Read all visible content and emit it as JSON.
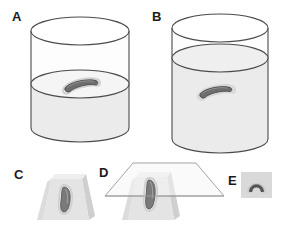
{
  "figure": {
    "background_color": "#ffffff",
    "width": 281,
    "height": 228
  },
  "panels": [
    {
      "id": "A",
      "label": "A",
      "caption": "Cylindrical container partially filled with liquid; curved specimen resting at the liquid surface",
      "container_shape": "cylinder",
      "fill_level_fraction": 0.45,
      "specimen_position": "at liquid surface",
      "specimen_shape": "curved elongated"
    },
    {
      "id": "B",
      "label": "B",
      "caption": "Cylindrical container filled with liquid; curved specimen fully submerged",
      "container_shape": "cylinder",
      "fill_level_fraction": 0.78,
      "specimen_position": "submerged in liquid",
      "specimen_shape": "curved elongated"
    },
    {
      "id": "C",
      "label": "C",
      "caption": "Trapezoidal embedding block containing the curved specimen oriented vertically",
      "container_shape": "trapezoidal block",
      "specimen_position": "embedded in block",
      "specimen_shape": "curved elongated"
    },
    {
      "id": "D",
      "label": "D",
      "caption": "Embedding block intersected by a horizontal sectioning plane through the specimen",
      "container_shape": "trapezoidal block with cutting plane",
      "specimen_position": "embedded in block",
      "specimen_shape": "curved elongated",
      "plane_shape": "parallelogram"
    },
    {
      "id": "E",
      "label": "E",
      "caption": "Resulting transverse section showing the arch-shaped specimen cross-section",
      "container_shape": "square section field",
      "specimen_position": "cross-section",
      "specimen_shape": "arch / inverted U"
    }
  ],
  "colors": {
    "outline": "#4a4a4a",
    "outline_light": "#8c8c8c",
    "liquid_fill": "#ebebeb",
    "glass_fill": "#fdfdfd",
    "block_fill": "#e2e2e2",
    "block_shade": "#d2d2d2",
    "block_light": "#eeeeee",
    "specimen_fill": "#6e6e6e",
    "specimen_dark": "#4f4f4f",
    "specimen_outline": "#cfcfcf",
    "section_field": "#d9d9d9",
    "label_color": "#1a1a1a",
    "plane_stroke": "#9a9a9a"
  }
}
